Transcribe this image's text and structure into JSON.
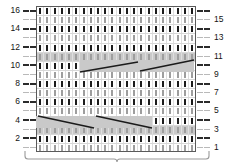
{
  "chart_data": {
    "type": "table",
    "title": "",
    "xlabel": "",
    "ylabel": "",
    "grid": {
      "rows": 16,
      "columns": 22
    },
    "row_numbers_left": [
      16,
      14,
      12,
      10,
      8,
      6,
      4,
      2
    ],
    "row_numbers_right": [
      15,
      13,
      11,
      9,
      7,
      5,
      3,
      1
    ],
    "row_order": "bottom-to-top, row 1 at bottom",
    "legend": [],
    "symbols": {
      "bold_bar": "knit-stitch-dark-bar",
      "light_bar": "knit-stitch-light-bar",
      "dash": "selvedge-dash",
      "diagonal": "cable-cross-line"
    },
    "rows": [
      {
        "number": 16,
        "emphasis": "bold",
        "shaded": false
      },
      {
        "number": 15,
        "emphasis": "light",
        "shaded": false
      },
      {
        "number": 14,
        "emphasis": "bold",
        "shaded": false
      },
      {
        "number": 13,
        "emphasis": "light",
        "shaded": false
      },
      {
        "number": 12,
        "emphasis": "bold",
        "shaded": false
      },
      {
        "number": 11,
        "emphasis": "light",
        "shaded": true
      },
      {
        "number": 10,
        "emphasis": "bold",
        "shaded": false
      },
      {
        "number": 9,
        "emphasis": "light",
        "shaded": false
      },
      {
        "number": 8,
        "emphasis": "bold",
        "shaded": false
      },
      {
        "number": 7,
        "emphasis": "light",
        "shaded": false
      },
      {
        "number": 6,
        "emphasis": "bold",
        "shaded": false
      },
      {
        "number": 5,
        "emphasis": "light",
        "shaded": false
      },
      {
        "number": 4,
        "emphasis": "bold",
        "shaded": false
      },
      {
        "number": 3,
        "emphasis": "light",
        "shaded": true
      },
      {
        "number": 2,
        "emphasis": "bold",
        "shaded": false
      },
      {
        "number": 1,
        "emphasis": "light",
        "shaded": false
      }
    ],
    "diagonal_lines": [
      {
        "name": "upper-left-diagonal",
        "direction": "ascending",
        "x1": 44,
        "y1": 66,
        "x2": 102,
        "y2": 56
      },
      {
        "name": "upper-right-diagonal",
        "direction": "ascending",
        "x1": 104,
        "y1": 65,
        "x2": 158,
        "y2": 54
      },
      {
        "name": "lower-left-diagonal",
        "direction": "descending",
        "x1": 2,
        "y1": 110,
        "x2": 58,
        "y2": 122
      },
      {
        "name": "lower-right-diagonal",
        "direction": "descending",
        "x1": 60,
        "y1": 110,
        "x2": 116,
        "y2": 122
      }
    ],
    "shaded_bands": [
      {
        "name": "upper-shaded-band",
        "x": 44,
        "y": 54,
        "width": 114,
        "height": 12
      },
      {
        "name": "lower-shaded-band",
        "x": 0,
        "y": 110,
        "width": 116,
        "height": 12
      }
    ],
    "repeat_brace": {
      "label": "",
      "spans_columns": 22
    }
  },
  "colors": {
    "grid_border": "#5a5a5a",
    "grid_line": "#dedede",
    "shade": "#c9c9c9",
    "symbol_dark": "#1b1b1b",
    "symbol_light": "#9e9e9e",
    "diagonal": "#1b1b1b",
    "text": "#141414",
    "background": "#ffffff"
  }
}
